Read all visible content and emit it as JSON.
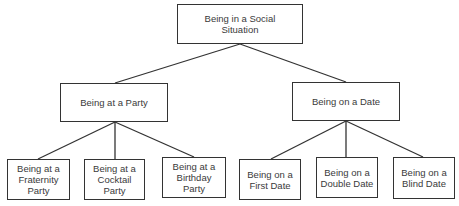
{
  "diagram": {
    "type": "hierarchy-tree",
    "root": {
      "label": "Being in a Social Situation",
      "lines": [
        "Being in a Social",
        "Situation"
      ]
    },
    "level1": [
      {
        "label": "Being at a Party",
        "children": [
          {
            "label": "Being at a Fraternity Party",
            "lines": [
              "Being at a",
              "Fraternity",
              "Party"
            ]
          },
          {
            "label": "Being at a Cocktail Party",
            "lines": [
              "Being at a",
              "Cocktail",
              "Party"
            ]
          },
          {
            "label": "Being at a Birthday Party",
            "lines": [
              "Being at a",
              "Birthday",
              "Party"
            ]
          }
        ]
      },
      {
        "label": "Being on a Date",
        "children": [
          {
            "label": "Being on a First Date",
            "lines": [
              "Being on a",
              "First Date"
            ]
          },
          {
            "label": "Being on a Double Date",
            "lines": [
              "Being on a",
              "Double Date"
            ]
          },
          {
            "label": "Being on a Blind Date",
            "lines": [
              "Being on a",
              "Blind Date"
            ]
          }
        ]
      }
    ],
    "colors": {
      "line": "#333333",
      "text": "#3a3a3a",
      "background": "#ffffff"
    }
  }
}
